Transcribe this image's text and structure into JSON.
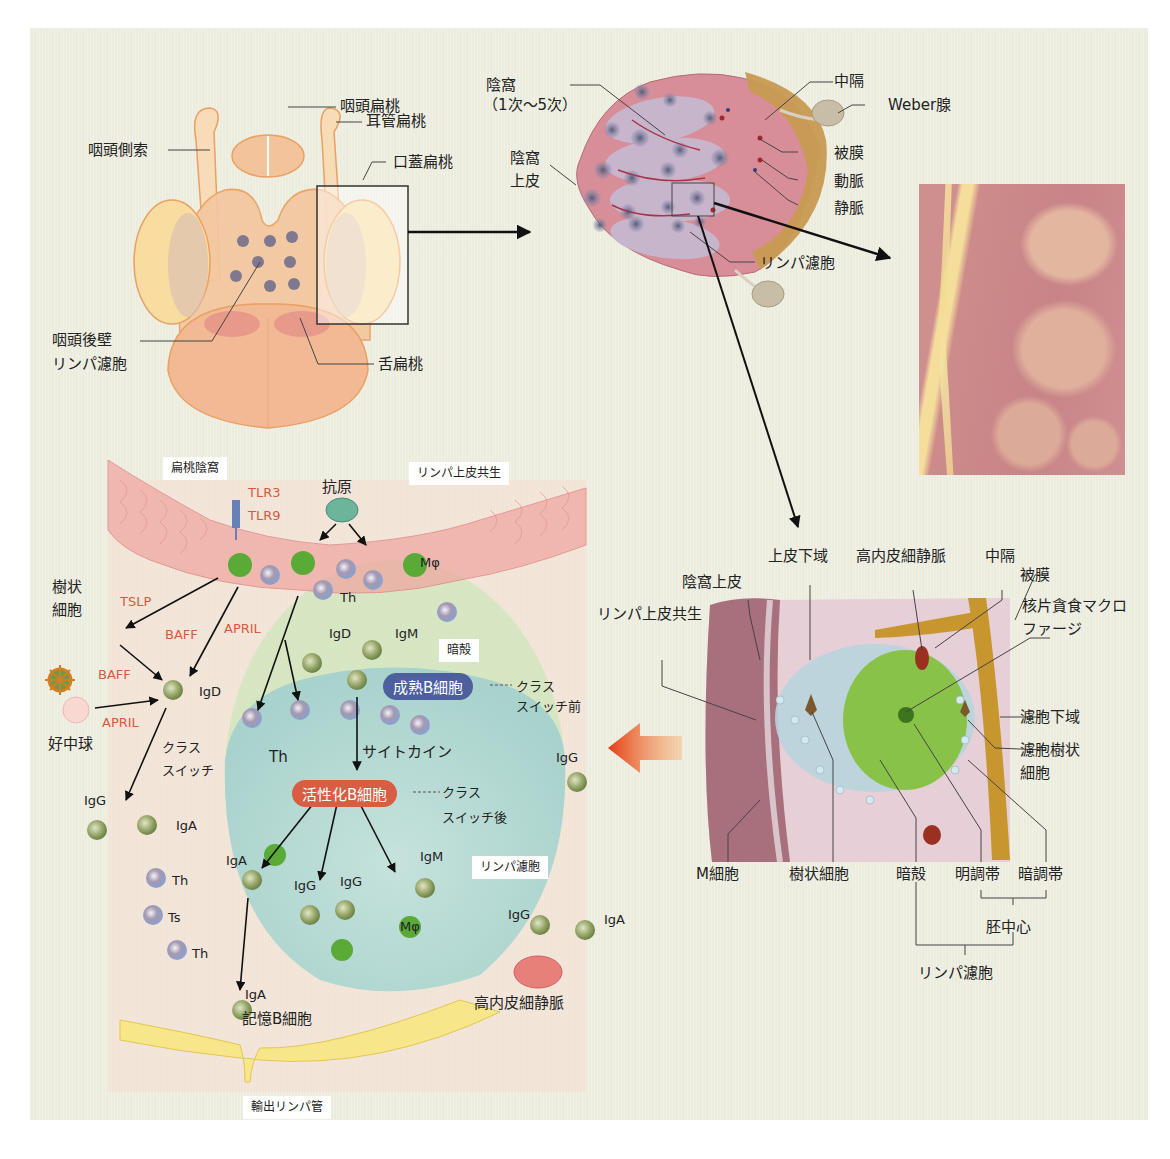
{
  "figure": {
    "background_color": "#efefe2",
    "accent_colors": {
      "cytokine_red": "#d85a3c",
      "mature_b_cell_pill": "#4e5f9e",
      "activated_b_cell_pill": "#d95d42",
      "arrow_orange": "#e8481e"
    }
  },
  "overview_panel": {
    "labels": {
      "nasopharyngeal_tonsil": "咽頭扁桃",
      "tubal_tonsil": "耳管扁桃",
      "lateral_pharyngeal_band": "咽頭側索",
      "palatine_tonsil": "口蓋扁桃",
      "posterior_pharyngeal_follicle_line1": "咽頭後壁",
      "posterior_pharyngeal_follicle_line2": "リンパ濾胞",
      "lingual_tonsil": "舌扁桃"
    }
  },
  "tonsil_section_panel": {
    "labels": {
      "crypt_line1": "陰窩",
      "crypt_line2": "（1次～5次）",
      "crypt_epithelium_line1": "陰窩",
      "crypt_epithelium_line2": "上皮",
      "septum": "中隔",
      "weber_gland": "Weber腺",
      "capsule": "被膜",
      "artery": "動脈",
      "vein": "静脈",
      "lymph_follicle": "リンパ濾胞"
    }
  },
  "detail_panel": {
    "labels": {
      "subepithelial_region": "上皮下域",
      "hev": "高内皮細静脈",
      "septum": "中隔",
      "crypt_epithelium": "陰窩上皮",
      "capsule": "被膜",
      "lymphoepithelial_symbiosis": "リンパ上皮共生",
      "tingible_body_macrophage_line1": "核片貪食マクロ",
      "tingible_body_macrophage_line2": "ファージ",
      "perifollicular_region": "濾胞下域",
      "fdc_line1": "濾胞樹状",
      "fdc_line2": "細胞",
      "m_cell": "M細胞",
      "dendritic_cell": "樹状細胞",
      "mantle_zone": "暗殻",
      "light_zone": "明調帯",
      "dark_zone": "暗調帯",
      "germinal_center": "胚中心",
      "lymph_follicle": "リンパ濾胞"
    }
  },
  "immune_panel": {
    "boxed_labels": {
      "tonsillar_crypt": "扁桃陰窩",
      "lymphoepithelial_symbiosis": "リンパ上皮共生",
      "mantle": "暗殻",
      "lymph_follicle": "リンパ濾胞",
      "efferent_lymphatic": "輸出リンパ管"
    },
    "labels": {
      "antigen": "抗原",
      "tlr3": "TLR3",
      "tlr9": "TLR9",
      "macrophage_top": "Mφ",
      "th_top": "Th",
      "dendritic_cell_line1": "樹状",
      "dendritic_cell_line2": "細胞",
      "tslp": "TSLP",
      "baff_1": "BAFF",
      "april_1": "APRIL",
      "baff_2": "BAFF",
      "april_2": "APRIL",
      "neutrophil": "好中球",
      "igd_left": "IgD",
      "class_switch_line1": "クラス",
      "class_switch_line2": "スイッチ",
      "igg_left": "IgG",
      "iga_left": "IgA",
      "th_1": "Th",
      "ts": "Ts",
      "th_2": "Th",
      "igd_top": "IgD",
      "igm_top": "IgM",
      "th_mid": "Th",
      "cytokine": "サイトカイン",
      "pre_switch_line1": "クラス",
      "pre_switch_line2": "スイッチ前",
      "post_switch_line1": "クラス",
      "post_switch_line2": "スイッチ後",
      "igg_right_single": "IgG",
      "iga_inner": "IgA",
      "igg_inner_1": "IgG",
      "igg_inner_2": "IgG",
      "igm_inner": "IgM",
      "macrophage_inner": "Mφ",
      "iga_memory": "IgA",
      "memory_b_cell": "記憶B細胞",
      "igg_right": "IgG",
      "iga_right": "IgA",
      "hev": "高内皮細静脈"
    },
    "pills": {
      "mature_b_cell": "成熟B細胞",
      "activated_b_cell": "活性化B細胞"
    }
  }
}
